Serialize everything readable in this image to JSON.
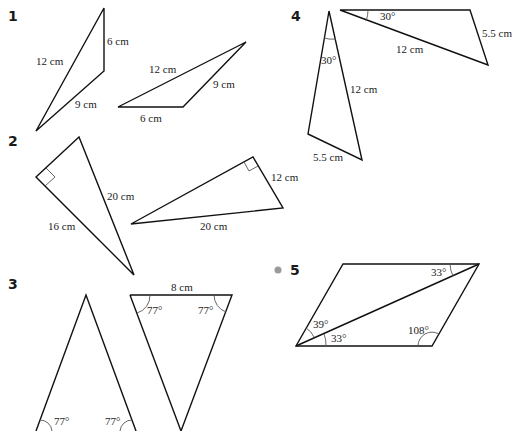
{
  "questions": [
    {
      "number": "1",
      "figures": [
        {
          "type": "triangle",
          "sides": [
            "12 cm",
            "6 cm",
            "9 cm"
          ]
        },
        {
          "type": "triangle",
          "sides": [
            "12 cm",
            "9 cm",
            "6 cm"
          ]
        }
      ]
    },
    {
      "number": "2",
      "figures": [
        {
          "type": "right-triangle",
          "sides": [
            "20 cm",
            "16 cm"
          ]
        },
        {
          "type": "right-triangle",
          "sides": [
            "12 cm",
            "20 cm"
          ]
        }
      ]
    },
    {
      "number": "3",
      "figures": [
        {
          "type": "isosceles-triangle",
          "angles": [
            "77°",
            "77°"
          ]
        },
        {
          "type": "isosceles-triangle",
          "sides": [
            "8 cm"
          ],
          "angles": [
            "77°",
            "77°"
          ]
        }
      ]
    },
    {
      "number": "4",
      "figures": [
        {
          "type": "triangle",
          "angles": [
            "30°"
          ],
          "sides": [
            "12 cm",
            "5.5 cm"
          ]
        },
        {
          "type": "triangle",
          "angles": [
            "30°"
          ],
          "sides": [
            "12 cm",
            "5.5 cm"
          ]
        }
      ]
    },
    {
      "number": "5",
      "bullet_color": "#9a9a9a",
      "figures": [
        {
          "type": "parallelogram-with-diagonal",
          "angles": [
            "33°",
            "39°",
            "33°",
            "108°"
          ]
        }
      ]
    }
  ],
  "colors": {
    "stroke": "#111111",
    "text": "#222222",
    "background": "#ffffff"
  }
}
